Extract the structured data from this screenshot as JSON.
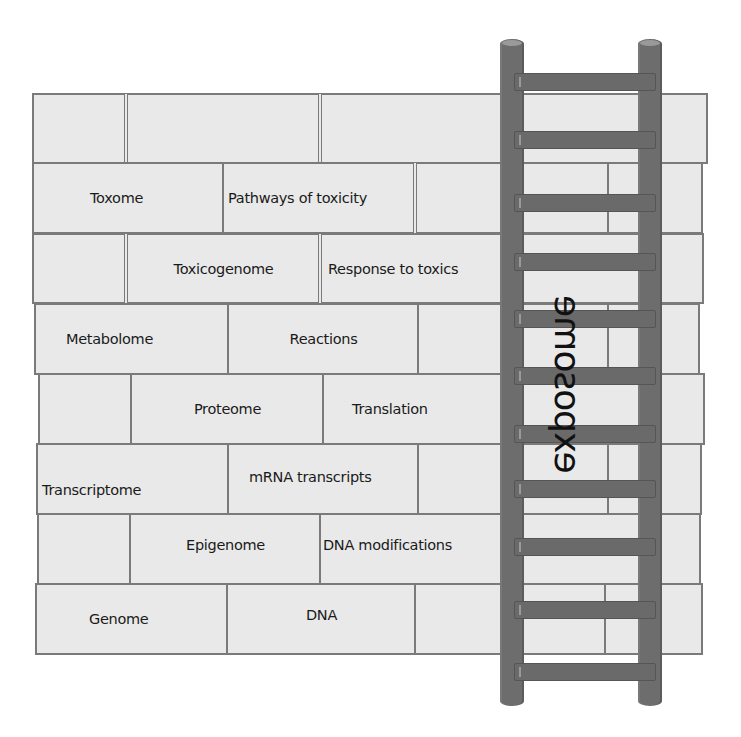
{
  "diagram": {
    "type": "brick-wall-with-ladder",
    "ladder_label": "exposome",
    "rows": [
      {
        "ome": "",
        "process": ""
      },
      {
        "ome": "Toxome",
        "process": "Pathways of toxicity"
      },
      {
        "ome": "Toxicogenome",
        "process": "Response to toxics"
      },
      {
        "ome": "Metabolome",
        "process": "Reactions"
      },
      {
        "ome": "Proteome",
        "process": "Translation"
      },
      {
        "ome": "Transcriptome",
        "process": "mRNA transcripts"
      },
      {
        "ome": "Epigenome",
        "process": "DNA modifications"
      },
      {
        "ome": "Genome",
        "process": "DNA"
      }
    ],
    "colors": {
      "brick_fill": "#e9e9e9",
      "brick_border": "#7a7a7a",
      "ladder": "#6d6d6d",
      "text": "#1a1a1a"
    }
  }
}
